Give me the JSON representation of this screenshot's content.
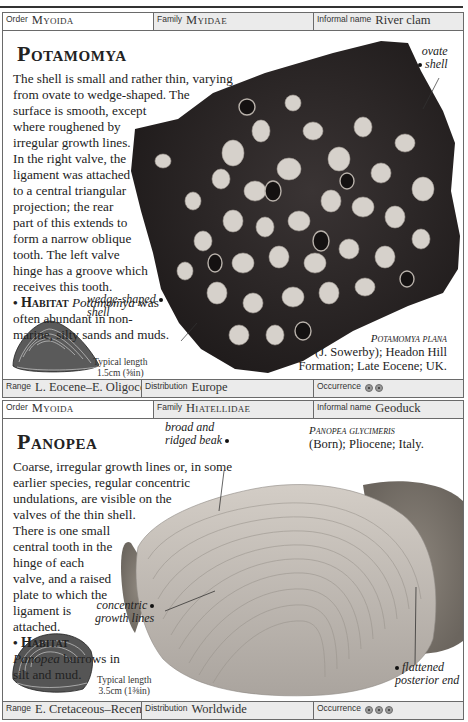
{
  "entries": [
    {
      "order_label": "Order",
      "order": "Myoida",
      "family_label": "Family",
      "family": "Myidae",
      "informal_label": "Informal name",
      "informal": "River clam",
      "genus": "Potamomya",
      "description_lines": [
        "The shell is small and rather thin, varying",
        "from ovate to wedge-shaped. The",
        "surface is smooth, except",
        "where roughened by",
        "irregular growth lines.",
        "In the right valve, the",
        "ligament was attached",
        "to a central triangular",
        "projection; the rear",
        "part of this extends to",
        "form a narrow oblique",
        "tooth. The left valve",
        "hinge has a groove which",
        "receives this tooth."
      ],
      "habitat_label": "Habitat",
      "habitat_genus": "Potamomya",
      "habitat_rest1": " was",
      "habitat_lines": [
        "often abundant in non-",
        "marine, silty sands and muds."
      ],
      "annotations": {
        "ovate_line1": "ovate",
        "ovate_line2": "shell",
        "wedge_line1": "wedge-shaped",
        "wedge_line2": "shell"
      },
      "specimen_species": "Potamomya plana",
      "specimen_line2": "(J. Sowerby); Headon Hill",
      "specimen_line3": "Formation; Late Eocene; UK.",
      "typical_label": "Typical length",
      "typical_size": "1.5cm (⅝in)",
      "range_label": "Range",
      "range": "L. Eocene–E. Oligocene",
      "distribution_label": "Distribution",
      "distribution": "Europe",
      "occurrence_label": "Occurrence",
      "occurrence_count": 2
    },
    {
      "order_label": "Order",
      "order": "Myoida",
      "family_label": "Family",
      "family": "Hiatellidae",
      "informal_label": "Informal name",
      "informal": "Geoduck",
      "genus": "Panopea",
      "description_lines": [
        "Coarse, irregular growth lines or, in some",
        "earlier species, regular concentric",
        "undulations, are visible on the",
        "valves of the thin shell.",
        "There is one small",
        "central tooth in the",
        "hinge of each",
        "valve, and a raised",
        "plate to which the",
        "ligament is",
        "attached."
      ],
      "habitat_label": "Habitat",
      "habitat_genus": "Panopea",
      "habitat_rest1": " burrows in",
      "habitat_lines": [
        "silt and mud."
      ],
      "annotations": {
        "beak_line1": "broad and",
        "beak_line2": "ridged beak",
        "concentric_line1": "concentric",
        "concentric_line2": "growth lines",
        "flattened_line1": "flattened",
        "flattened_line2": "posterior end"
      },
      "specimen_species": "Panopea glycimeris",
      "specimen_line2": "(Born); Pliocene; Italy.",
      "typical_label": "Typical length",
      "typical_size": "3.5cm (1⅜in)",
      "range_label": "Range",
      "range": "E. Cretaceous–Recent",
      "distribution_label": "Distribution",
      "distribution": "Worldwide",
      "occurrence_label": "Occurrence",
      "occurrence_count": 3
    }
  ],
  "colors": {
    "header_bg": "#ebebeb",
    "border": "#6a6a6a",
    "rock_dark": "#2b2626",
    "shell_pale": "#cfcac4"
  }
}
